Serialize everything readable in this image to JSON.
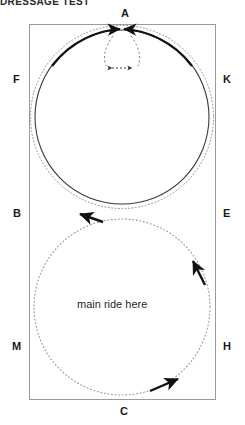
{
  "heading": {
    "text": "DRESSAGE TEST"
  },
  "arena": {
    "markers": [
      {
        "id": "A",
        "label": "A",
        "x": 121,
        "y": 8,
        "position": "top-center"
      },
      {
        "id": "F",
        "label": "F",
        "x": 13,
        "y": 74,
        "position": "left-upper"
      },
      {
        "id": "K",
        "label": "K",
        "x": 223,
        "y": 74,
        "position": "right-upper"
      },
      {
        "id": "B",
        "label": "B",
        "x": 13,
        "y": 208,
        "position": "left-middle"
      },
      {
        "id": "E",
        "label": "E",
        "x": 223,
        "y": 208,
        "position": "right-middle"
      },
      {
        "id": "M",
        "label": "M",
        "x": 12,
        "y": 341,
        "position": "left-lower"
      },
      {
        "id": "H",
        "label": "H",
        "x": 223,
        "y": 341,
        "position": "right-lower"
      },
      {
        "id": "C",
        "label": "C",
        "x": 120,
        "y": 406,
        "position": "bottom-center"
      }
    ],
    "annotations": [
      {
        "id": "main-ride",
        "text": "main ride here",
        "x": 77,
        "y": 298
      }
    ],
    "rect": {
      "x": 29,
      "y": 24,
      "width": 187,
      "height": 376
    },
    "upper_circle": {
      "cx": 122,
      "cy": 117,
      "r": 88,
      "style": "solid-and-dotted"
    },
    "lower_circle": {
      "cx": 122,
      "cy": 307,
      "r": 88,
      "style": "dotted"
    },
    "colors": {
      "stroke": "#3a3a3a",
      "dotted": "#8a8a8a",
      "arrow": "#111111",
      "text": "#1a1a1a",
      "background": "#ffffff"
    },
    "arrows": [
      {
        "id": "arrow-converge-left",
        "direction": "right",
        "near": "A"
      },
      {
        "id": "arrow-converge-right",
        "direction": "left",
        "near": "A"
      },
      {
        "id": "arrow-dashed-spread",
        "direction": "both",
        "near": "A"
      },
      {
        "id": "arrow-down-left",
        "direction": "down-left",
        "near": "B"
      },
      {
        "id": "arrow-up-left",
        "direction": "up-left",
        "near": "E"
      },
      {
        "id": "arrow-up-right",
        "direction": "up-right",
        "near": "C"
      }
    ]
  }
}
